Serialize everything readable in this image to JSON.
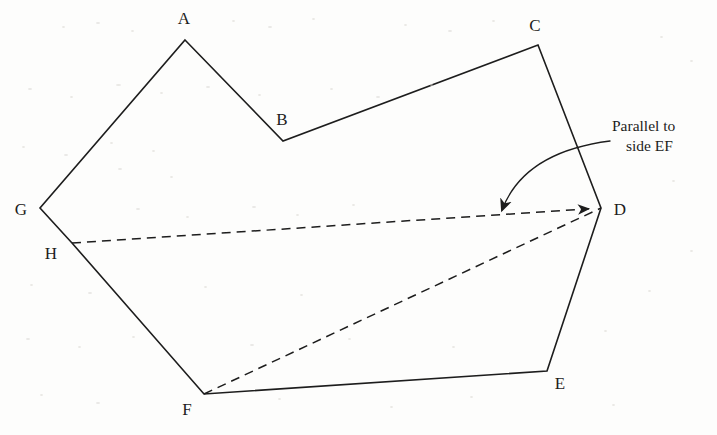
{
  "figure": {
    "background_color": "#fdfdfc",
    "stroke_color": "#1d1d1d",
    "solid_stroke_width": 1.6,
    "dashed_stroke_width": 1.5,
    "dash_pattern": "9 6",
    "vertices": [
      {
        "id": "A",
        "x": 185,
        "y": 40,
        "label": "A",
        "label_x": 184,
        "label_y": 18
      },
      {
        "id": "B",
        "x": 283,
        "y": 141,
        "label": "B",
        "label_x": 282,
        "label_y": 119
      },
      {
        "id": "C",
        "x": 538,
        "y": 45,
        "label": "C",
        "label_x": 535,
        "label_y": 25
      },
      {
        "id": "D",
        "x": 601,
        "y": 208,
        "label": "D",
        "label_x": 620,
        "label_y": 209
      },
      {
        "id": "E",
        "x": 547,
        "y": 371,
        "label": "E",
        "label_x": 560,
        "label_y": 383
      },
      {
        "id": "F",
        "x": 204,
        "y": 394,
        "label": "F",
        "label_x": 187,
        "label_y": 409
      },
      {
        "id": "G",
        "x": 40,
        "y": 208,
        "label": "G",
        "label_x": 21,
        "label_y": 209
      },
      {
        "id": "H",
        "x": 72,
        "y": 243,
        "label": "H",
        "label_x": 51,
        "label_y": 253
      }
    ],
    "outline_order": [
      "A",
      "B",
      "C",
      "D",
      "E",
      "F",
      "H",
      "G"
    ],
    "dashed_segments": [
      {
        "name": "segment-HD",
        "from": "H",
        "to": "D",
        "arrowhead_at_end": true
      },
      {
        "name": "segment-FD",
        "from": "F",
        "to": "D",
        "arrowhead_at_end": false
      }
    ],
    "annotation": {
      "name": "parallel-note",
      "line1": "Parallel to",
      "line2": "side EF",
      "text_x": 612,
      "text_y": 116,
      "arrow": {
        "name": "curved-pointer",
        "start_x": 610,
        "start_y": 141,
        "control_x": 524,
        "control_y": 152,
        "end_x": 502,
        "end_y": 210
      }
    }
  }
}
